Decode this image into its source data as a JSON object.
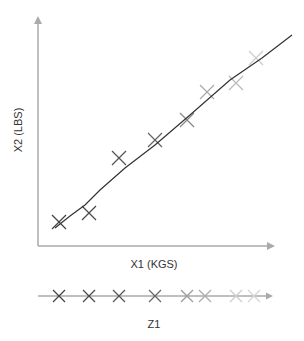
{
  "chart_data": {
    "type": "scatter",
    "title": "",
    "xlabel": "X1 (KGS)",
    "ylabel": "X2 (LBS)",
    "projection_axis_label": "Z1",
    "grid": false,
    "legend": null,
    "points": [
      {
        "x": 59,
        "y": 222,
        "color": "#444444"
      },
      {
        "x": 89,
        "y": 213,
        "color": "#4a4a4a"
      },
      {
        "x": 119,
        "y": 158,
        "color": "#555555"
      },
      {
        "x": 155,
        "y": 140,
        "color": "#666666"
      },
      {
        "x": 187,
        "y": 120,
        "color": "#888888"
      },
      {
        "x": 207,
        "y": 92,
        "color": "#aaaaaa"
      },
      {
        "x": 236,
        "y": 83,
        "color": "#bbbbbb"
      },
      {
        "x": 256,
        "y": 58,
        "color": "#cccccc"
      }
    ],
    "projections": [
      {
        "x": 59,
        "color": "#444444"
      },
      {
        "x": 89,
        "color": "#4a4a4a"
      },
      {
        "x": 119,
        "color": "#555555"
      },
      {
        "x": 155,
        "color": "#666666"
      },
      {
        "x": 187,
        "color": "#999999"
      },
      {
        "x": 205,
        "color": "#aaaaaa"
      },
      {
        "x": 236,
        "color": "#cccccc"
      },
      {
        "x": 254,
        "color": "#d5d5d5"
      }
    ],
    "fit_line": [
      [
        55,
        228
      ],
      [
        70,
        216
      ],
      [
        85,
        205
      ],
      [
        100,
        190
      ],
      [
        125,
        168
      ],
      [
        155,
        145
      ],
      [
        190,
        115
      ],
      [
        230,
        80
      ],
      [
        262,
        58
      ],
      [
        292,
        35
      ]
    ]
  },
  "colors": {
    "axis": "#aaaaaa",
    "fit_line": "#333333"
  }
}
